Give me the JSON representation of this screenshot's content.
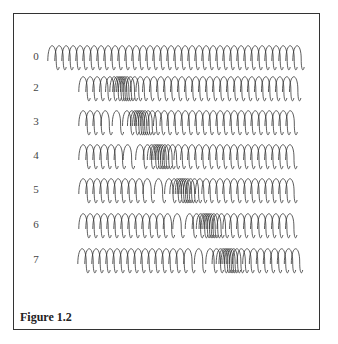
{
  "figure": {
    "caption": "Figure 1.2",
    "rows": [
      {
        "label": "0",
        "y": 57,
        "x_start": 48,
        "x_end": 303,
        "compression_center": null,
        "gap_x": null
      },
      {
        "label": "2",
        "y": 88,
        "x_start": 79,
        "x_end": 300,
        "compression_center": 120,
        "gap_x": null
      },
      {
        "label": "3",
        "y": 122,
        "x_start": 79,
        "x_end": 300,
        "compression_center": 138,
        "gap_x": 110
      },
      {
        "label": "4",
        "y": 156,
        "x_start": 79,
        "x_end": 300,
        "compression_center": 157,
        "gap_x": 128
      },
      {
        "label": "5",
        "y": 190,
        "x_start": 79,
        "x_end": 300,
        "compression_center": 181,
        "gap_x": 152
      },
      {
        "label": "6",
        "y": 225,
        "x_start": 79,
        "x_end": 300,
        "compression_center": 206,
        "gap_x": 176
      },
      {
        "label": "7",
        "y": 260,
        "x_start": 78,
        "x_end": 300,
        "compression_center": 226,
        "gap_x": 194
      }
    ]
  },
  "colors": {
    "ink": "#333333",
    "dense": "#111111",
    "border": "#333333"
  }
}
